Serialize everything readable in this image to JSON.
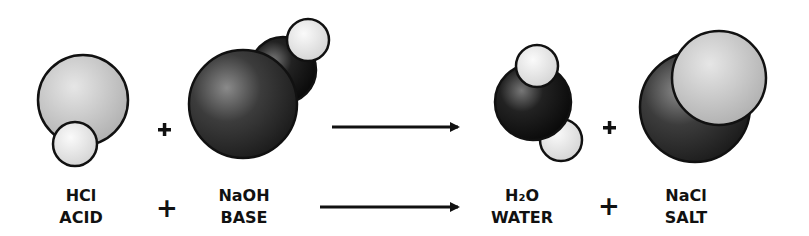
{
  "equation": {
    "reactants": [
      {
        "formula": "HCl",
        "name": "ACID"
      },
      {
        "formula": "NaOH",
        "name": "BASE"
      }
    ],
    "products": [
      {
        "formula": "H₂O",
        "name": "WATER"
      },
      {
        "formula": "NaCl",
        "name": "SALT"
      }
    ],
    "plus": "+"
  },
  "colors": {
    "light_atom": "#c8c8c8",
    "white_atom": "#ececec",
    "dark_atom": "#333333",
    "outline": "#111111",
    "text": "#111111"
  }
}
